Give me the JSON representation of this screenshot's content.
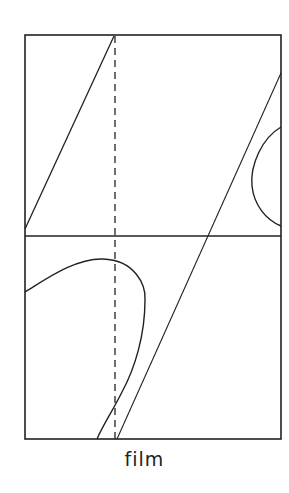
{
  "diagram": {
    "caption": "film",
    "stroke_color": "#222222",
    "background": "#ffffff",
    "frame": {
      "x": 25,
      "y": 35,
      "width": 256,
      "height": 404
    },
    "horizontal_divider_y": 236,
    "dashed_vertical_x": 115,
    "elements": [
      {
        "name": "upper-diagonal-line",
        "type": "line",
        "from": [
          25,
          229
        ],
        "to": [
          114,
          36
        ]
      },
      {
        "name": "long-diagonal-line",
        "type": "line",
        "from": [
          281,
          73
        ],
        "to": [
          117,
          439
        ]
      },
      {
        "name": "right-edge-loop",
        "type": "curve",
        "start": [
          281,
          127
        ],
        "apex": [
          252,
          186
        ],
        "end": [
          281,
          226
        ]
      },
      {
        "name": "lower-loop-curve",
        "type": "curve",
        "start": [
          25,
          292
        ],
        "peak": [
          103,
          258
        ],
        "rightmost": [
          145,
          300
        ],
        "end": [
          97,
          439
        ]
      },
      {
        "name": "dashed-reference-line",
        "type": "dashed-line",
        "from": [
          115,
          35
        ],
        "to": [
          115,
          439
        ]
      }
    ]
  }
}
